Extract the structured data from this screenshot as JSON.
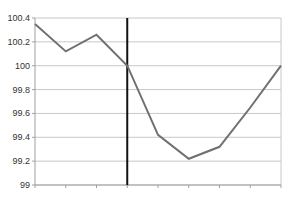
{
  "chart_data": {
    "type": "line",
    "title": "",
    "xlabel": "",
    "ylabel": "",
    "x": [
      0,
      1,
      2,
      3,
      4,
      5,
      6,
      7,
      8
    ],
    "categories": [
      "",
      "",
      "",
      "",
      "",
      "",
      "",
      "",
      ""
    ],
    "series": [
      {
        "name": "Series 1",
        "values": [
          100.35,
          100.12,
          100.26,
          100.0,
          99.42,
          99.22,
          99.32,
          99.65,
          100.0
        ],
        "color": "#707070"
      }
    ],
    "ylim": [
      99,
      100.4
    ],
    "yticks": [
      "100.4",
      "100.2",
      "100",
      "99.8",
      "99.6",
      "99.4",
      "99.2",
      "99"
    ],
    "ytick_values": [
      100.4,
      100.2,
      100.0,
      99.8,
      99.6,
      99.4,
      99.2,
      99.0
    ],
    "grid": true,
    "legend": "none",
    "annotations": [
      {
        "type": "vertical-line",
        "x_index": 3,
        "color": "#111111"
      }
    ]
  },
  "colors": {
    "gridline": "#c8c8c8",
    "series_line": "#707070",
    "marker_line": "#111111",
    "axis": "#a0a0a0"
  }
}
